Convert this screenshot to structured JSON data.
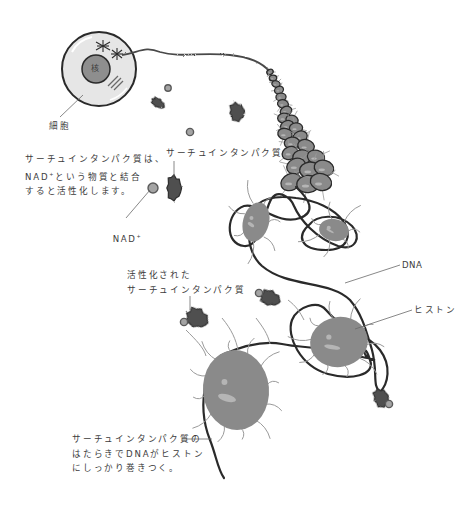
{
  "colors": {
    "outline": "#2a2a2a",
    "cell_fill": "#e6e6e6",
    "nucleus_fill": "#8e8e8e",
    "histone_fill": "#8a8a8a",
    "histone_highlight": "#b5b5b5",
    "sirtuin_fill": "#4f4f4f",
    "nad_fill": "#a4a4a4",
    "tail_stroke": "#9a9a9a",
    "leader_line": "#6a6a6a"
  },
  "labels": {
    "nucleus": "核",
    "cell": "細胞",
    "sirtuin": "サーチュインタンパク質",
    "nad": "NAD",
    "nad_superscript": "+",
    "activated_sirtuin_line1": "活性化された",
    "activated_sirtuin_line2": "サーチュインタンパク質",
    "dna": "DNA",
    "histone": "ヒストン"
  },
  "notes": {
    "activation": {
      "line1": "サーチュインタンパク質は、",
      "line2_prefix": "NAD",
      "line2_sup": "+",
      "line2_suffix": "という物質と結合",
      "line3": "すると活性化します。"
    },
    "wrapping": {
      "line1": "サーチュインタンパク質の",
      "line2": "はたらきでDNAがヒストン",
      "line3": "にしっかり巻きつく。"
    }
  },
  "elements": [
    {
      "name": "cell",
      "kind": "cell"
    },
    {
      "name": "chromatin-fiber",
      "kind": "fiber"
    },
    {
      "name": "nucleosome-chain",
      "kind": "chain"
    },
    {
      "name": "histone",
      "kind": "histone",
      "count": 4
    },
    {
      "name": "sirtuin-protein",
      "kind": "sirtuin",
      "count": 4
    },
    {
      "name": "activated-sirtuin",
      "kind": "sirtuin-with-nad",
      "count": 3
    },
    {
      "name": "nad-molecule",
      "kind": "nad",
      "count": 3
    }
  ]
}
